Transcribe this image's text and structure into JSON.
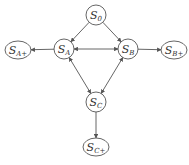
{
  "diagram": {
    "type": "state-graph",
    "colors": {
      "stroke": "#555555",
      "text": "#333333",
      "background": "#ffffff"
    },
    "nodes": [
      {
        "id": "S0",
        "base": "S",
        "sub": "0",
        "label": "S0",
        "shape": "circle",
        "cx": 96,
        "cy": 15,
        "rx": 10,
        "ry": 10
      },
      {
        "id": "SA",
        "base": "S",
        "sub": "A",
        "label": "SA",
        "shape": "circle",
        "cx": 64,
        "cy": 49,
        "rx": 10,
        "ry": 10
      },
      {
        "id": "SB",
        "base": "S",
        "sub": "B",
        "label": "SB",
        "shape": "circle",
        "cx": 128,
        "cy": 49,
        "rx": 10,
        "ry": 10
      },
      {
        "id": "SA+",
        "base": "S",
        "sub": "A+",
        "label": "SA+",
        "shape": "ellipse",
        "cx": 18,
        "cy": 50,
        "rx": 13,
        "ry": 9
      },
      {
        "id": "SB+",
        "base": "S",
        "sub": "B+",
        "label": "SB+",
        "shape": "ellipse",
        "cx": 174,
        "cy": 50,
        "rx": 13,
        "ry": 9
      },
      {
        "id": "SC",
        "base": "S",
        "sub": "C",
        "label": "SC",
        "shape": "circle",
        "cx": 96,
        "cy": 102,
        "rx": 10,
        "ry": 10
      },
      {
        "id": "SC+",
        "base": "S",
        "sub": "C+",
        "label": "SC+",
        "shape": "ellipse",
        "cx": 96,
        "cy": 147,
        "rx": 13,
        "ry": 9
      }
    ],
    "edges": [
      {
        "from": "S0",
        "to": "SA",
        "bidirectional": false
      },
      {
        "from": "S0",
        "to": "SB",
        "bidirectional": false
      },
      {
        "from": "SA",
        "to": "SB",
        "bidirectional": true
      },
      {
        "from": "SA",
        "to": "SA+",
        "bidirectional": false
      },
      {
        "from": "SB",
        "to": "SB+",
        "bidirectional": false
      },
      {
        "from": "SA",
        "to": "SC",
        "bidirectional": true
      },
      {
        "from": "SB",
        "to": "SC",
        "bidirectional": true
      },
      {
        "from": "SC",
        "to": "SC+",
        "bidirectional": false
      }
    ]
  }
}
